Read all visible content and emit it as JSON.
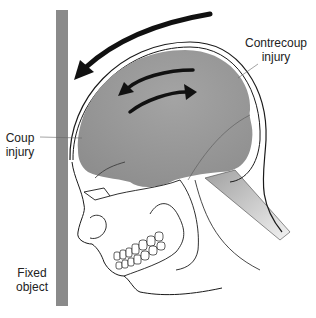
{
  "diagram": {
    "type": "medical-illustration",
    "labels": {
      "contrecoup": [
        "Contrecoup",
        "injury"
      ],
      "coup": [
        "Coup",
        "injury"
      ],
      "fixed_object": [
        "Fixed",
        "object"
      ]
    },
    "colors": {
      "fixed_object": "#8a8a8a",
      "brain": "#9c9c9c",
      "brain_dark": "#7f7f7f",
      "spinal_cord": "#a8a8a8",
      "outline": "#1a1a1a",
      "arrow": "#111111",
      "text": "#222222"
    },
    "arrows": [
      {
        "name": "head-motion-arrow",
        "direction": "right-to-left (toward fixed object)"
      },
      {
        "name": "brain-motion-arrow-left",
        "direction": "leftward"
      },
      {
        "name": "brain-motion-arrow-right",
        "direction": "rightward"
      }
    ]
  }
}
